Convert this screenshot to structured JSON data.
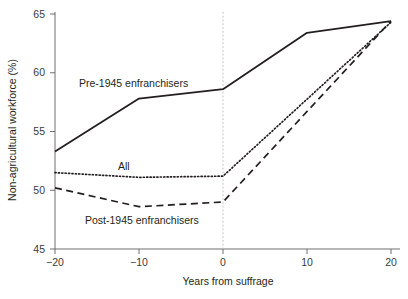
{
  "chart_data": {
    "type": "line",
    "title": "",
    "xlabel": "Years from suffrage",
    "ylabel": "Non-agricultural workforce (%)",
    "x": [
      -20,
      -10,
      0,
      10,
      20
    ],
    "xlim": [
      -20,
      20
    ],
    "ylim": [
      45,
      65
    ],
    "xticks": [
      -20,
      -10,
      0,
      10,
      20
    ],
    "xtick_labels": [
      "−20",
      "−10",
      "0",
      "10",
      "20"
    ],
    "yticks": [
      45,
      50,
      55,
      60,
      65
    ],
    "ytick_labels": [
      "45",
      "50",
      "55",
      "60",
      "65"
    ],
    "grid": false,
    "legend": "inline-annotations",
    "reference_line_x": 0,
    "series": [
      {
        "name": "Pre-1945 enfranchisers",
        "style": "solid",
        "color": "#231f20",
        "x": [
          -20,
          -10,
          0,
          10,
          20
        ],
        "values": [
          53.3,
          57.8,
          58.6,
          63.4,
          64.4
        ]
      },
      {
        "name": "All",
        "style": "dotted",
        "color": "#231f20",
        "x": [
          -20,
          -10,
          0,
          20
        ],
        "values": [
          51.5,
          51.1,
          51.2,
          64.3
        ]
      },
      {
        "name": "Post-1945 enfranchisers",
        "style": "dashed",
        "color": "#231f20",
        "x": [
          -20,
          -10,
          0,
          20
        ],
        "values": [
          50.2,
          48.6,
          49.0,
          64.4
        ]
      }
    ],
    "annotations": [
      {
        "text": "Pre-1945 enfranchisers",
        "x_px": 79,
        "y_px": 87
      },
      {
        "text": "All",
        "x_px": 118,
        "y_px": 170
      },
      {
        "text": "Post-1945 enfranchisers",
        "x_px": 85,
        "y_px": 224
      }
    ]
  },
  "axes": {
    "y_title": "Non-agricultural workforce (%)",
    "x_title": "Years from suffrage"
  }
}
